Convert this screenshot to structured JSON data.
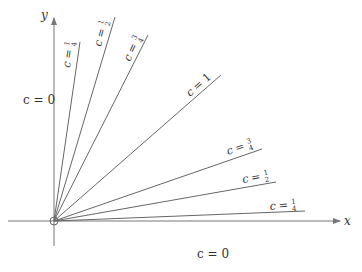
{
  "diagram": {
    "axes": {
      "x_label": "x",
      "y_label": "y"
    },
    "origin_marker": "open-circle",
    "colors": {
      "line": "#666666",
      "axis": "#777777",
      "text": "#333333"
    },
    "lines": [
      {
        "c": "1/4",
        "side": "steep",
        "label_var": "c",
        "label_eq": "=",
        "num": "1",
        "den": "4"
      },
      {
        "c": "1/2",
        "side": "steep",
        "label_var": "c",
        "label_eq": "=",
        "num": "1",
        "den": "2"
      },
      {
        "c": "3/4",
        "side": "steep",
        "label_var": "c",
        "label_eq": "=",
        "num": "3",
        "den": "4"
      },
      {
        "c": "1",
        "side": "diagonal",
        "label_var": "c",
        "label_eq": "=",
        "value": "1"
      },
      {
        "c": "3/4",
        "side": "shallow",
        "label_var": "c",
        "label_eq": "=",
        "num": "3",
        "den": "4"
      },
      {
        "c": "1/2",
        "side": "shallow",
        "label_var": "c",
        "label_eq": "=",
        "num": "1",
        "den": "2"
      },
      {
        "c": "1/4",
        "side": "shallow",
        "label_var": "c",
        "label_eq": "=",
        "num": "1",
        "den": "4"
      }
    ],
    "axis_labels": {
      "y_axis_c": "c = 0",
      "x_axis_c": "c = 0"
    }
  }
}
